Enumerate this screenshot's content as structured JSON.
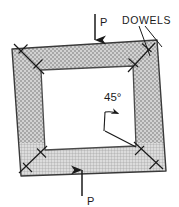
{
  "figure": {
    "type": "engineering-diagram",
    "background_color": "#ffffff",
    "line_color": "#1a1a1a",
    "fill_color": "#cccccc",
    "opening_color": "#ffffff"
  },
  "labels": {
    "load_top": "P",
    "load_bottom": "P",
    "dowels": "DOWELS",
    "angle": "45°"
  },
  "arrows": {
    "top": {
      "name": "top-load-arrow",
      "direction": "down",
      "x": 95,
      "y_start": 14,
      "y_end": 43,
      "label": "P",
      "label_x": 100,
      "label_y": 16
    },
    "bottom": {
      "name": "bottom-load-arrow",
      "direction": "up",
      "x": 82,
      "y_start": 196,
      "y_end": 167,
      "label": "P",
      "label_x": 87,
      "label_y": 203
    }
  },
  "frame": {
    "outer_points": "12,49 157,40 166,171 21,176",
    "inner_points": "41,70 133,66 136,146 45,150"
  },
  "dowels": [
    {
      "name": "dowel-top-left",
      "x1": 14,
      "y1": 44,
      "x2": 44,
      "y2": 74
    },
    {
      "name": "dowel-top-right",
      "x1": 155,
      "y1": 43,
      "x2": 128,
      "y2": 72
    },
    {
      "name": "dowel-bottom-left",
      "x1": 19,
      "y1": 173,
      "x2": 47,
      "y2": 146
    },
    {
      "name": "dowel-bottom-right",
      "x1": 163,
      "y1": 169,
      "x2": 134,
      "y2": 142
    }
  ],
  "annotations": {
    "angle_line": {
      "x1": 105,
      "y1": 131,
      "x2": 136,
      "y2": 146
    },
    "angle_arc_center": {
      "x": 136,
      "y": 146
    },
    "angle_label_x": 107,
    "angle_label_y": 98,
    "dowels_label_x": 124,
    "dowels_label_y": 21,
    "dowels_leaders": [
      {
        "x1": 140,
        "y1": 25,
        "x2": 151,
        "y2": 55
      },
      {
        "x1": 144,
        "y1": 25,
        "x2": 161,
        "y2": 48
      }
    ]
  }
}
